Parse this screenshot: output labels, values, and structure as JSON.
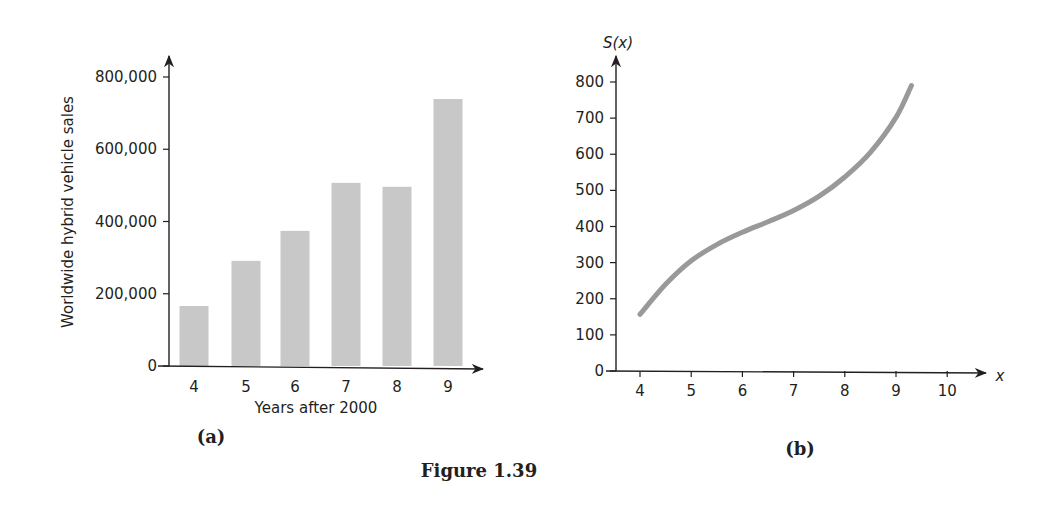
{
  "figure": {
    "caption": "Figure 1.39"
  },
  "chart_data": [
    {
      "panel": "(a)",
      "type": "bar",
      "title": "",
      "xlabel": "Years after 2000",
      "ylabel": "Worldwide hybrid vehicle sales",
      "categories": [
        "4",
        "5",
        "6",
        "7",
        "8",
        "9"
      ],
      "values": [
        166000,
        291000,
        374000,
        507000,
        496000,
        739000
      ],
      "yticks": [
        "0",
        "200,000",
        "400,000",
        "600,000",
        "800,000"
      ],
      "ylim": [
        0,
        800000
      ],
      "grid": false,
      "legend": null,
      "bar_color": "#c8c8c8"
    },
    {
      "panel": "(b)",
      "type": "line",
      "title": "",
      "xlabel": "x",
      "ylabel": "S(x)",
      "x": [
        4,
        4.5,
        5,
        5.5,
        6,
        6.5,
        7,
        7.5,
        8,
        8.5,
        9,
        9.3
      ],
      "values": [
        157,
        240,
        305,
        350,
        384,
        413,
        444,
        484,
        537,
        605,
        702,
        790
      ],
      "xticks": [
        "4",
        "5",
        "6",
        "7",
        "8",
        "9",
        "10"
      ],
      "yticks": [
        "0",
        "100",
        "200",
        "300",
        "400",
        "500",
        "600",
        "700",
        "800"
      ],
      "xlim": [
        4,
        10
      ],
      "ylim": [
        0,
        800
      ],
      "grid": false,
      "legend": null,
      "line_color": "#999999"
    }
  ]
}
